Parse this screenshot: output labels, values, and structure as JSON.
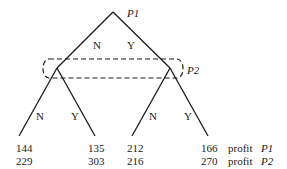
{
  "diagram": {
    "type": "game-tree",
    "root": {
      "player_label": "P1",
      "branches": [
        "N",
        "Y"
      ]
    },
    "information_set": {
      "player_label": "P2",
      "style": "dashed-rounded-box"
    },
    "left_subtree": {
      "branches": [
        "N",
        "Y"
      ]
    },
    "right_subtree": {
      "branches": [
        "N",
        "Y"
      ]
    },
    "payoffs": {
      "p1_row": [
        "144",
        "135",
        "212",
        "166"
      ],
      "p2_row": [
        "229",
        "303",
        "216",
        "270"
      ],
      "row_labels": [
        {
          "word": "profit",
          "player": "P1"
        },
        {
          "word": "profit",
          "player": "P2"
        }
      ]
    },
    "colors": {
      "line": "#1a1a1a",
      "background": "#ffffff"
    }
  }
}
